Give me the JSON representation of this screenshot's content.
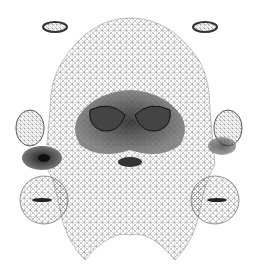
{
  "image": {
    "description": "Wireframe triangle mesh UV layout of a face texture with separated ears, eyes, nostrils and lips patches",
    "width": 260,
    "height": 274,
    "colors": {
      "background": "#ffffff",
      "mesh": "#555555",
      "dark": "#222222",
      "mid": "#888888"
    }
  }
}
